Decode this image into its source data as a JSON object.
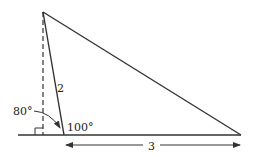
{
  "diagram": {
    "type": "triangle-geometry",
    "stroke_color": "#333333",
    "labels": {
      "side_left": "2",
      "side_base": "3",
      "angle_exterior": "80°",
      "angle_interior": "100°"
    },
    "elements": [
      "triangle",
      "dashed altitude",
      "right-angle marker",
      "extended base line",
      "curved arrow to exterior angle",
      "dimension arrow for base"
    ]
  }
}
